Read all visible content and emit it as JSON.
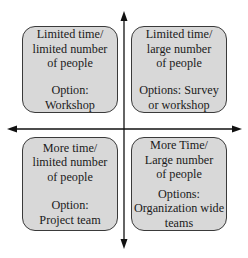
{
  "diagram": {
    "type": "quadrant-matrix",
    "axes": {
      "horizontal": {
        "direction": "bidirectional",
        "label": ""
      },
      "vertical": {
        "direction": "bidirectional",
        "label": ""
      }
    },
    "colors": {
      "box_fill": "#d8d8d8",
      "box_border": "#3a3a3a",
      "axis": "#111111",
      "text": "#1a1a1a"
    },
    "quadrants": {
      "top_left": {
        "condition": [
          "Limited time/",
          "limited number",
          "of people"
        ],
        "option": [
          "Option:",
          "Workshop"
        ]
      },
      "top_right": {
        "condition": [
          "Limited time/",
          "large number",
          "of people"
        ],
        "option": [
          "Options: Survey",
          "or workshop"
        ]
      },
      "bottom_left": {
        "condition": [
          "More time/",
          "limited number",
          "of people"
        ],
        "option": [
          "Option:",
          "Project team"
        ]
      },
      "bottom_right": {
        "condition": [
          "More Time/",
          "Large number",
          "of people"
        ],
        "option": [
          "Options:",
          "Organization wide",
          "teams"
        ]
      }
    }
  }
}
